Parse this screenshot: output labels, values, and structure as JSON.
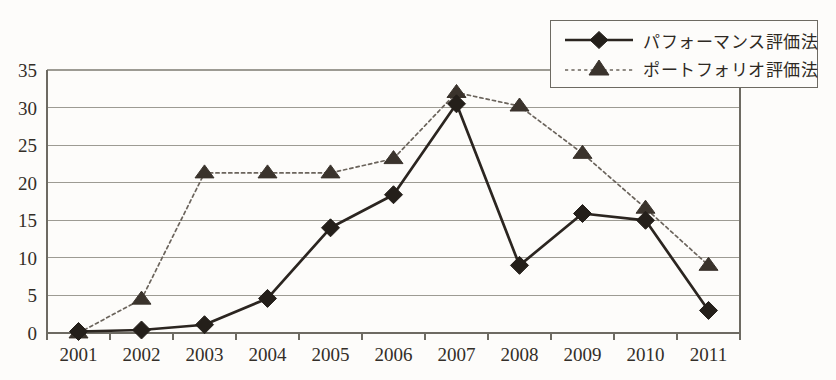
{
  "chart_data": {
    "type": "line",
    "title": "",
    "subtitle": "",
    "xlabel": "",
    "ylabel": "",
    "categories": [
      "2001",
      "2002",
      "2003",
      "2004",
      "2005",
      "2006",
      "2007",
      "2008",
      "2009",
      "2010",
      "2011"
    ],
    "yticks": [
      0,
      5,
      10,
      15,
      20,
      25,
      30,
      35
    ],
    "ylim": [
      0,
      35
    ],
    "grid": true,
    "legend_position": "top-right",
    "series": [
      {
        "name": "パフォーマンス評価法",
        "marker": "diamond",
        "linestyle": "solid",
        "color": "#2b2520",
        "values": [
          0.2,
          0.4,
          1.1,
          4.6,
          14.0,
          18.4,
          30.5,
          9.0,
          15.9,
          15.0,
          3.0
        ]
      },
      {
        "name": "ポートフォリオ評価法",
        "marker": "triangle",
        "linestyle": "dotted",
        "color": "#6b645c",
        "values": [
          0.0,
          4.5,
          21.3,
          21.3,
          21.3,
          23.2,
          32.0,
          30.2,
          23.9,
          16.6,
          9.0
        ]
      }
    ]
  },
  "legend": {
    "items": [
      {
        "label": "パフォーマンス評価法",
        "marker": "diamond-marker-icon",
        "linestyle": "solid"
      },
      {
        "label": "ポートフォリオ評価法",
        "marker": "triangle-marker-icon",
        "linestyle": "dotted"
      }
    ]
  },
  "colors": {
    "background": "#fdfcfa",
    "gridline": "#9d9b93",
    "axis": "#6d6a62",
    "series_solid": "#2b2520",
    "series_dotted": "#6b645c",
    "text": "#332e28"
  }
}
